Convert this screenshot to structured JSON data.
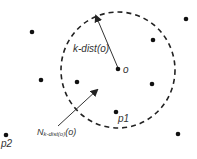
{
  "diagram": {
    "type": "k-distance neighborhood illustration",
    "center_point": {
      "label": "o",
      "x": 118,
      "y": 69
    },
    "circle": {
      "cx": 118,
      "cy": 70,
      "rx": 57,
      "ry": 58,
      "style": "dashed"
    },
    "labels": {
      "k_dist": "k-dist(o)",
      "neighborhood": "Nₖ-dist(o)(o)",
      "neighborhood_main": "N",
      "neighborhood_sub": "k-dist(o)",
      "neighborhood_tail": "(o)",
      "p1": "p1",
      "p2": "p2",
      "o": "o"
    },
    "points": [
      {
        "x": 32,
        "y": 32
      },
      {
        "x": 41,
        "y": 80
      },
      {
        "x": 77,
        "y": 82
      },
      {
        "x": 153,
        "y": 40
      },
      {
        "x": 152,
        "y": 84
      },
      {
        "x": 186,
        "y": 19
      },
      {
        "x": 178,
        "y": 134
      },
      {
        "x": 116,
        "y": 112,
        "label": "p1"
      },
      {
        "x": 6,
        "y": 135,
        "label": "p2"
      },
      {
        "x": 118,
        "y": 69,
        "label": "o"
      }
    ]
  }
}
